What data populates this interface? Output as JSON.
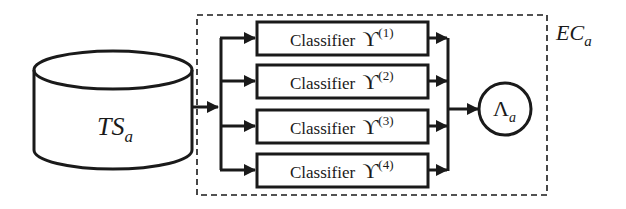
{
  "diagram": {
    "data_store": {
      "label_main": "TS",
      "label_sub": "a"
    },
    "ensemble": {
      "label_main": "EC",
      "label_sub": "a"
    },
    "classifiers": [
      {
        "prefix": "Classifier ",
        "symbol": "ϒ",
        "superscript": "(1)"
      },
      {
        "prefix": "Classifier ",
        "symbol": "ϒ",
        "superscript": "(2)"
      },
      {
        "prefix": "Classifier ",
        "symbol": "ϒ",
        "superscript": "(3)"
      },
      {
        "prefix": "Classifier ",
        "symbol": "ϒ",
        "superscript": "(4)"
      }
    ],
    "combiner": {
      "label_main": "Λ",
      "label_sub": "a"
    },
    "colors": {
      "line": "#1a1a1a",
      "background": "#ffffff"
    }
  }
}
